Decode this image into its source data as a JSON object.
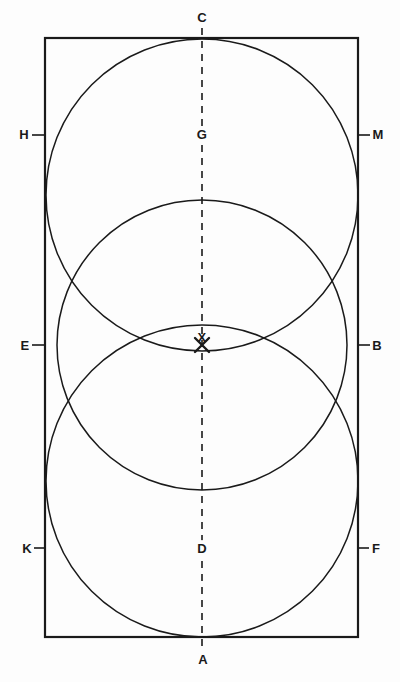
{
  "figure": {
    "kind": "geometric-construction",
    "background_color": "#fdfdfd",
    "stroke_color": "#1a1a1a",
    "canvas": {
      "width": 400,
      "height": 682
    }
  },
  "rectangle": {
    "name": "bounding-rectangle",
    "x": 45,
    "y": 38,
    "width": 313,
    "height": 599,
    "stroke_width": 2.2
  },
  "axis": {
    "name": "vertical-dashed-axis",
    "x": 202,
    "y_top": 28,
    "y_bottom": 650,
    "dash": "7 6",
    "stroke_width": 1.6
  },
  "circles": [
    {
      "id": "circle-top",
      "cx": 202,
      "cy": 195,
      "r": 156,
      "stroke_width": 1.5
    },
    {
      "id": "circle-middle",
      "cx": 202,
      "cy": 345,
      "r": 145,
      "stroke_width": 1.5
    },
    {
      "id": "circle-bottom",
      "cx": 202,
      "cy": 481,
      "r": 156,
      "stroke_width": 1.5
    }
  ],
  "cross_mark": {
    "name": "intersection-cross-x",
    "cx": 202,
    "cy": 345,
    "arm": 7,
    "stroke_width": 2.4
  },
  "labels": [
    {
      "id": "label-C",
      "text": "C",
      "x": 202,
      "y": 22,
      "anchor": "middle",
      "tick": null
    },
    {
      "id": "label-G",
      "text": "G",
      "x": 202,
      "y": 139,
      "anchor": "middle",
      "tick": null
    },
    {
      "id": "label-H",
      "text": "H",
      "x": 24,
      "y": 139,
      "anchor": "middle",
      "tick": {
        "x1": 32,
        "y1": 135,
        "x2": 46,
        "y2": 135
      }
    },
    {
      "id": "label-M",
      "text": "M",
      "x": 378,
      "y": 139,
      "anchor": "middle",
      "tick": {
        "x1": 357,
        "y1": 135,
        "x2": 370,
        "y2": 135
      }
    },
    {
      "id": "label-E",
      "text": "E",
      "x": 25,
      "y": 350,
      "anchor": "middle",
      "tick": {
        "x1": 32,
        "y1": 345,
        "x2": 46,
        "y2": 345
      }
    },
    {
      "id": "label-B",
      "text": "B",
      "x": 377,
      "y": 350,
      "anchor": "middle",
      "tick": {
        "x1": 357,
        "y1": 345,
        "x2": 370,
        "y2": 345
      }
    },
    {
      "id": "label-K",
      "text": "K",
      "x": 27,
      "y": 553,
      "anchor": "middle",
      "tick": {
        "x1": 34,
        "y1": 548,
        "x2": 46,
        "y2": 548
      }
    },
    {
      "id": "label-F",
      "text": "F",
      "x": 376,
      "y": 553,
      "anchor": "middle",
      "tick": {
        "x1": 357,
        "y1": 548,
        "x2": 369,
        "y2": 548
      }
    },
    {
      "id": "label-D",
      "text": "D",
      "x": 202,
      "y": 553,
      "anchor": "middle",
      "tick": null
    },
    {
      "id": "label-A",
      "text": "A",
      "x": 203,
      "y": 664,
      "anchor": "middle",
      "tick": null
    },
    {
      "id": "label-X",
      "text": "X",
      "x": 202,
      "y": 342,
      "anchor": "middle",
      "tick": null
    }
  ],
  "label_mask_radius": {
    "rx": 7,
    "ry": 9
  }
}
